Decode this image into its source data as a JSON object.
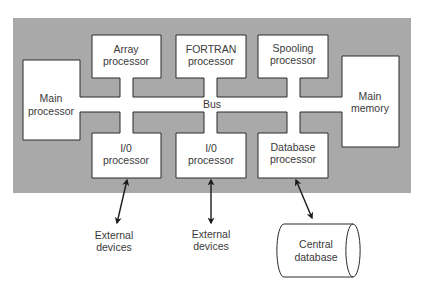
{
  "diagram": {
    "bus_label": "Bus",
    "nodes": {
      "main_processor": {
        "line1": "Main",
        "line2": "processor"
      },
      "array_processor": {
        "line1": "Array",
        "line2": "processor"
      },
      "fortran_processor": {
        "line1": "FORTRAN",
        "line2": "processor"
      },
      "spooling_processor": {
        "line1": "Spooling",
        "line2": "processor"
      },
      "main_memory": {
        "line1": "Main",
        "line2": "memory"
      },
      "io_processor_1": {
        "line1": "I/0",
        "line2": "processor"
      },
      "io_processor_2": {
        "line1": "I/0",
        "line2": "processor"
      },
      "database_processor": {
        "line1": "Database",
        "line2": "processor"
      }
    },
    "external": {
      "devices_1": {
        "line1": "External",
        "line2": "devices"
      },
      "devices_2": {
        "line1": "External",
        "line2": "devices"
      },
      "central_database": {
        "line1": "Central",
        "line2": "database"
      }
    },
    "colors": {
      "background_panel": "#a9a9a9",
      "box_fill": "#ffffff",
      "stroke": "#2a2a2a"
    }
  }
}
